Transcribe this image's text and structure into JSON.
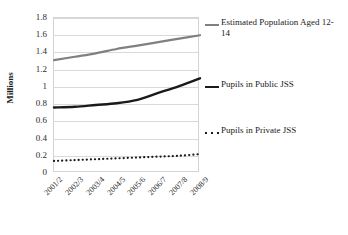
{
  "chart_data": {
    "type": "line",
    "title": "",
    "xlabel": "",
    "ylabel": "Millions",
    "categories": [
      "2001/2",
      "2002/3",
      "2003/4",
      "2004/5",
      "2005/6",
      "2006/7",
      "2007/8",
      "2008/9"
    ],
    "ylim": [
      0,
      1.8
    ],
    "ytick_labels": [
      "0",
      "0.2",
      "0.4",
      "0.6",
      "0.8",
      "1",
      "1.2",
      "1.4",
      "1.6",
      "1.8"
    ],
    "ytick_values": [
      0,
      0.2,
      0.4,
      0.6,
      0.8,
      1.0,
      1.2,
      1.4,
      1.6,
      1.8
    ],
    "grid": true,
    "legend_position": "right",
    "series": [
      {
        "name": "Estimated Population Aged 12-14",
        "style": "solid",
        "color": "#808080",
        "values": [
          1.31,
          1.35,
          1.39,
          1.44,
          1.48,
          1.52,
          1.56,
          1.6
        ]
      },
      {
        "name": "Pupils in Public JSS",
        "style": "solid",
        "color": "#1a1a1a",
        "values": [
          0.76,
          0.77,
          0.79,
          0.81,
          0.85,
          0.93,
          1.01,
          1.1
        ]
      },
      {
        "name": "Pupils in Private JSS",
        "style": "dotted",
        "color": "#1a1a1a",
        "values": [
          0.14,
          0.15,
          0.16,
          0.17,
          0.18,
          0.19,
          0.2,
          0.22
        ]
      }
    ]
  },
  "legend": {
    "entries": [
      {
        "label": "Estimated Population Aged 12-14",
        "style": "solid",
        "color": "#808080"
      },
      {
        "label": "Pupils in Public JSS",
        "style": "solid",
        "color": "#1a1a1a"
      },
      {
        "label": "Pupils in Private JSS",
        "style": "dotted",
        "color": "#1a1a1a"
      }
    ]
  }
}
